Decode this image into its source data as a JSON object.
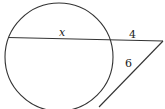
{
  "diagram": {
    "type": "circle-secant-tangent",
    "labels": {
      "chord": "x",
      "external_secant": "4",
      "tangent": "6"
    },
    "colors": {
      "stroke": "#333333",
      "background": "#ffffff"
    }
  }
}
